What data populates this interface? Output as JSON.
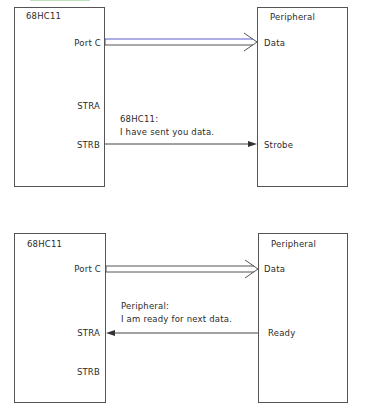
{
  "diagrams": [
    {
      "mcu": {
        "title": "68HC11",
        "pins": {
          "portc": "Port C",
          "stra": "STRA",
          "strb": "STRB"
        }
      },
      "peripheral": {
        "title": "Peripheral",
        "pins": {
          "data": "Data",
          "signal": "Strobe"
        }
      },
      "message": {
        "line1": "68HC11:",
        "line2": "I have sent you data."
      },
      "arrow_direction": "mcu-to-peripheral"
    },
    {
      "mcu": {
        "title": "68HC11",
        "pins": {
          "portc": "Port C",
          "stra": "STRA",
          "strb": "STRB"
        }
      },
      "peripheral": {
        "title": "Peripheral",
        "pins": {
          "data": "Data",
          "signal": "Ready"
        }
      },
      "message": {
        "line1": "Peripheral:",
        "line2": "I am ready for next data."
      },
      "arrow_direction": "peripheral-to-mcu"
    }
  ],
  "colors": {
    "line": "#444444",
    "bus_accent": "#5a5ad0",
    "text": "#2b2b2b"
  }
}
